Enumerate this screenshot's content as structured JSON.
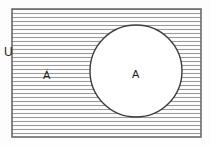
{
  "figure": {
    "type": "venn-diagram",
    "title": "",
    "background_color": "#fdfdfd",
    "stroke_color": "#4a4a4a",
    "hatch_color": "#8a8a8a",
    "text_color": "#1c1c1c"
  },
  "labels": {
    "universe": "U",
    "set": "A",
    "complement": "Á"
  },
  "regions": {
    "universe_rect": {
      "name": "universal-set-rectangle",
      "x": 12,
      "y": 9,
      "width": 189,
      "height": 128,
      "shaded": true,
      "shading": "horizontal-hatch"
    },
    "set_circle": {
      "name": "set-a-circle",
      "cx": 136,
      "cy": 71,
      "r": 46,
      "shaded": false
    }
  },
  "hatch": {
    "orientation": "horizontal",
    "spacing_px": 4,
    "line_width_px": 1
  }
}
